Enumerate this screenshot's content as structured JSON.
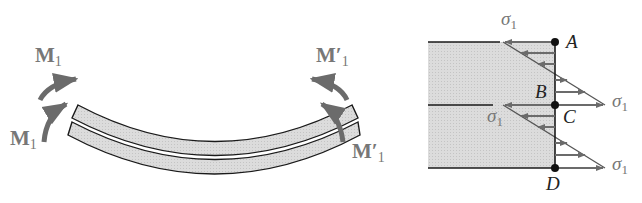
{
  "left_figure": {
    "moment_labels": {
      "upper_left": {
        "main": "M",
        "sub": "1",
        "prime": ""
      },
      "lower_left": {
        "main": "M",
        "sub": "1",
        "prime": ""
      },
      "upper_right": {
        "main": "M",
        "sub": "1",
        "prime": "′"
      },
      "lower_right": {
        "main": "M",
        "sub": "1",
        "prime": "′"
      }
    }
  },
  "right_figure": {
    "points": {
      "A": "A",
      "B": "B",
      "C": "C",
      "D": "D"
    },
    "stress_labels": {
      "top": {
        "main": "σ",
        "sub": "1"
      },
      "upper_right": {
        "main": "σ",
        "sub": "1"
      },
      "middle": {
        "main": "σ",
        "sub": "1"
      },
      "lower_right": {
        "main": "σ",
        "sub": "1"
      }
    }
  },
  "colors": {
    "arrow": "#6b6b6b",
    "beam_fill": "#d9d9d9",
    "outline": "#1a1a1a",
    "label": "#777777"
  }
}
